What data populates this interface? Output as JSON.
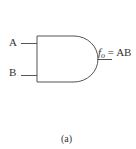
{
  "diagram": {
    "type": "logic-gate",
    "gate": "AND",
    "inputs": [
      {
        "label": "A"
      },
      {
        "label": "B"
      }
    ],
    "output": {
      "func": "f",
      "subscript": "o",
      "expression": " = AB"
    },
    "caption": "(a)",
    "stroke_color": "#555555"
  }
}
